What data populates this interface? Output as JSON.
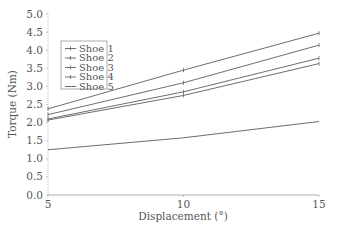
{
  "chart_data": {
    "type": "line",
    "title": "",
    "xlabel": "Displacement (°)",
    "ylabel": "Torque (Nm)",
    "x": [
      5,
      10,
      15
    ],
    "xlim": [
      5,
      15
    ],
    "ylim": [
      0.0,
      5.0
    ],
    "xticks": [
      "5",
      "10",
      "15"
    ],
    "yticks": [
      "0.0",
      "0.5",
      "1.0",
      "1.5",
      "2.0",
      "2.5",
      "3.0",
      "3.5",
      "4.0",
      "4.5",
      "5.0"
    ],
    "grid": false,
    "legend_position": "upper left (inset)",
    "series": [
      {
        "name": "Shoe 1",
        "values": [
          2.38,
          3.45,
          4.47
        ]
      },
      {
        "name": "Shoe 2",
        "values": [
          2.22,
          3.1,
          4.14
        ]
      },
      {
        "name": "Shoe 3",
        "values": [
          2.1,
          2.85,
          3.78
        ]
      },
      {
        "name": "Shoe 4",
        "values": [
          2.07,
          2.75,
          3.63
        ]
      },
      {
        "name": "Shoe 5",
        "values": [
          1.25,
          1.58,
          2.03
        ]
      }
    ]
  },
  "colors": {
    "line": "#6e6e6e",
    "axis": "#9a9a9a",
    "text": "#555555"
  }
}
